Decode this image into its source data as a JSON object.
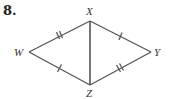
{
  "problem_number": "8.",
  "vertices": {
    "X": {
      "label": "X",
      "x": 90,
      "y": 21
    },
    "W": {
      "label": "W",
      "x": 29,
      "y": 52
    },
    "Y": {
      "label": "Y",
      "x": 151,
      "y": 52
    },
    "Z": {
      "label": "Z",
      "x": 90,
      "y": 85
    }
  },
  "segments": [
    {
      "from": "W",
      "to": "X",
      "ticks": 2
    },
    {
      "from": "X",
      "to": "Y",
      "ticks": 1
    },
    {
      "from": "W",
      "to": "Z",
      "ticks": 1
    },
    {
      "from": "Z",
      "to": "Y",
      "ticks": 2
    },
    {
      "from": "X",
      "to": "Z",
      "ticks": 0
    }
  ],
  "colors": {
    "line": "#555555",
    "text": "#333333"
  }
}
